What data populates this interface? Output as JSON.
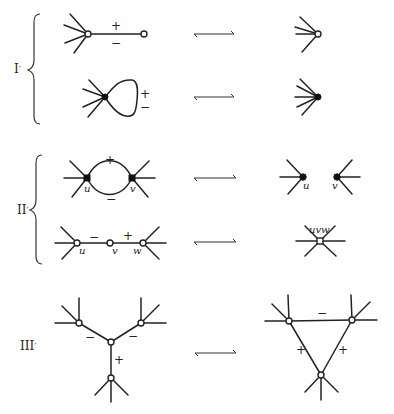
{
  "figure": {
    "type": "graph-move-diagram",
    "rows": [
      {
        "label": "I′",
        "moves": [
          {
            "name": "I-a",
            "left": "vertex with fan of 4 edges joined by edge signed +/− to leaf vertex",
            "right": "vertex with fan of 4 edges",
            "edge_sign_top": "+",
            "edge_sign_bottom": "−"
          },
          {
            "name": "I-b",
            "left": "solid vertex with fan of 4 edges and loop signed +/−",
            "right": "solid vertex with fan of 5 edges",
            "edge_sign_top": "+",
            "edge_sign_bottom": "−"
          }
        ]
      },
      {
        "label": "II′",
        "moves": [
          {
            "name": "II-a",
            "left": "two solid vertices u, v joined by double edge (+ top, − bottom)",
            "right": "separated solid vertices u and v",
            "sign_top": "+",
            "sign_bottom": "−",
            "vertex_labels": [
              "u",
              "v"
            ]
          },
          {
            "name": "II-b",
            "left": "path u −(−)− v −(+)− w",
            "right": "merged vertex uvw",
            "sign_uv": "−",
            "sign_vw": "+",
            "vertex_labels": [
              "u",
              "v",
              "w"
            ],
            "merged_label": "uvw"
          }
        ]
      },
      {
        "label": "III′",
        "moves": [
          {
            "name": "III",
            "left": "Y-shaped star: center joined to three vertices with signs −, −, +",
            "right": "triangle with sides −, +, +",
            "left_signs": [
              "−",
              "−",
              "+"
            ],
            "right_signs": [
              "−",
              "+",
              "+"
            ]
          }
        ]
      }
    ],
    "arrow_symbol": "⟷",
    "labels": {
      "row1": "I",
      "row2": "II",
      "row3": "III",
      "prime": "′",
      "plus": "+",
      "minus": "−",
      "u": "u",
      "v": "v",
      "w": "w",
      "uvw": "uvw"
    }
  }
}
